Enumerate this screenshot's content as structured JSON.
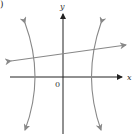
{
  "figure": {
    "part_label": ")",
    "x_axis_label": "x",
    "y_axis_label": "y",
    "origin_label": "0"
  },
  "colors": {
    "axes": "#222222",
    "curves": "#888888",
    "background": "#ffffff"
  }
}
